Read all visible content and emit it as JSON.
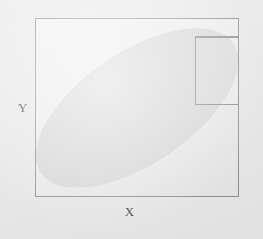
{
  "figure": {
    "type": "diagram",
    "background_color": "#e9e9e9",
    "plot_background_color": "#ededed",
    "frame_color": "#8b8b8b",
    "region_fill_color": "#d8d8d8"
  },
  "axes": {
    "x_label": "X",
    "y_label": "Y"
  },
  "shapes": {
    "plot_frame": {
      "name": "outer-rectangle",
      "x": 35,
      "y": 18,
      "width": 204,
      "height": 179
    },
    "inset_rectangle": {
      "name": "inset-rectangle-upper-right",
      "x": 159,
      "y": 18,
      "width": 80,
      "height": 68
    },
    "region": {
      "name": "shaded-ellipse-region",
      "center_x": 137,
      "center_y": 107,
      "semi_major": 116,
      "semi_minor": 56,
      "rotation_degrees": -34
    }
  }
}
